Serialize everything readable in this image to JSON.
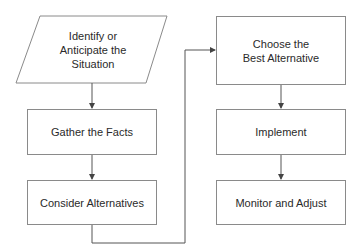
{
  "diagram": {
    "type": "flowchart",
    "line_color": "#8a8a8a",
    "text_color": "#2a2a2a",
    "nodes": [
      {
        "id": "identify",
        "shape": "parallelogram",
        "label": "Identify or\nAnticipate the\nSituation"
      },
      {
        "id": "gather",
        "shape": "rectangle",
        "label": "Gather the Facts"
      },
      {
        "id": "consider",
        "shape": "rectangle",
        "label": "Consider Alternatives"
      },
      {
        "id": "choose",
        "shape": "rectangle",
        "label": "Choose the\nBest Alternative"
      },
      {
        "id": "implement",
        "shape": "rectangle",
        "label": "Implement"
      },
      {
        "id": "monitor",
        "shape": "rectangle",
        "label": "Monitor and Adjust"
      }
    ],
    "edges": [
      {
        "from": "identify",
        "to": "gather"
      },
      {
        "from": "gather",
        "to": "consider"
      },
      {
        "from": "consider",
        "to": "choose"
      },
      {
        "from": "choose",
        "to": "implement"
      },
      {
        "from": "implement",
        "to": "monitor"
      }
    ]
  }
}
